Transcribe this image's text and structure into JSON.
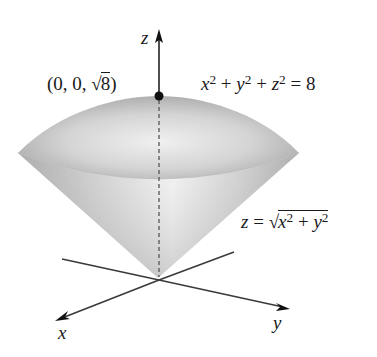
{
  "figure": {
    "type": "3d-surface-diagram",
    "colors": {
      "surface_light": "#f2f2f2",
      "surface_dark": "#a3a3a3",
      "axis": "#3a3a3a",
      "point": "#111111",
      "text": "#1a1a1a"
    }
  },
  "axes": {
    "z_label": "z",
    "x_label": "x",
    "y_label": "y"
  },
  "point": {
    "label_prefix": "(0, 0, ",
    "label_radical": "√",
    "label_radicand": "8",
    "label_suffix": ")"
  },
  "surfaces": {
    "sphere": {
      "lhs_x": "x",
      "lhs_y": "y",
      "lhs_z": "z",
      "exp": "2",
      "plus": " + ",
      "equals": " = ",
      "rhs": "8"
    },
    "cone": {
      "lhs": "z",
      "equals": " = ",
      "radical": "√",
      "x": "x",
      "y": "y",
      "exp": "2",
      "plus": " + "
    }
  }
}
